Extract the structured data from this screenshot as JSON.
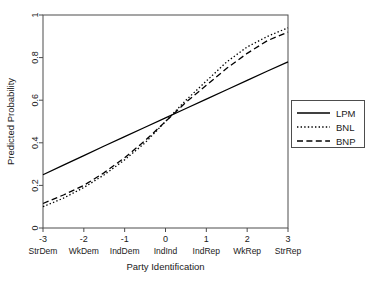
{
  "chart_data": {
    "type": "line",
    "title": "",
    "xlabel": "Party Identification",
    "ylabel": "Predicted Probability",
    "xlim": [
      -3,
      3
    ],
    "ylim": [
      0,
      1
    ],
    "grid": false,
    "legend_position": "right-outside",
    "x_tick_values": [
      "-3",
      "-2",
      "-1",
      "0",
      "1",
      "2",
      "3"
    ],
    "x_category_labels": [
      "StrDem",
      "WkDem",
      "IndDem",
      "IndInd",
      "IndRep",
      "WkRep",
      "StrRep"
    ],
    "y_tick_values": [
      "0",
      "0.2",
      "0.4",
      "0.6",
      "0.8",
      "1"
    ],
    "x": [
      -3,
      -2.5,
      -2,
      -1.5,
      -1,
      -0.5,
      0,
      0.5,
      1,
      1.5,
      2,
      2.5,
      3
    ],
    "series": [
      {
        "name": "LPM",
        "style": "solid",
        "values": [
          0.25,
          0.295,
          0.34,
          0.385,
          0.429,
          0.473,
          0.517,
          0.561,
          0.605,
          0.649,
          0.693,
          0.737,
          0.78
        ]
      },
      {
        "name": "BNL",
        "style": "dotted",
        "values": [
          0.1,
          0.14,
          0.19,
          0.25,
          0.32,
          0.4,
          0.5,
          0.6,
          0.69,
          0.78,
          0.85,
          0.9,
          0.94
        ]
      },
      {
        "name": "BNP",
        "style": "dashed",
        "values": [
          0.115,
          0.155,
          0.2,
          0.26,
          0.33,
          0.41,
          0.5,
          0.59,
          0.67,
          0.75,
          0.82,
          0.88,
          0.92
        ]
      }
    ]
  },
  "legend": {
    "entries": [
      {
        "label": "LPM",
        "style": "solid"
      },
      {
        "label": "BNL",
        "style": "dotted"
      },
      {
        "label": "BNP",
        "style": "dashed"
      }
    ]
  }
}
